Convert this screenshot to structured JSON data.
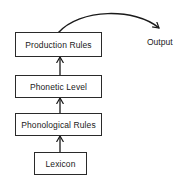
{
  "diagram": {
    "boxes": [
      {
        "id": "production-rules",
        "label": "Production Rules"
      },
      {
        "id": "phonetic-level",
        "label": "Phonetic Level"
      },
      {
        "id": "phonological-rules",
        "label": "Phonological Rules"
      },
      {
        "id": "lexicon",
        "label": "Lexicon"
      }
    ],
    "output_label": "Output",
    "edges": [
      {
        "from": "lexicon",
        "to": "phonological-rules"
      },
      {
        "from": "phonological-rules",
        "to": "phonetic-level"
      },
      {
        "from": "phonetic-level",
        "to": "production-rules"
      },
      {
        "from": "production-rules",
        "to": "output",
        "style": "curved"
      }
    ],
    "colors": {
      "line": "#1a1a1a",
      "background": "#ffffff"
    }
  }
}
